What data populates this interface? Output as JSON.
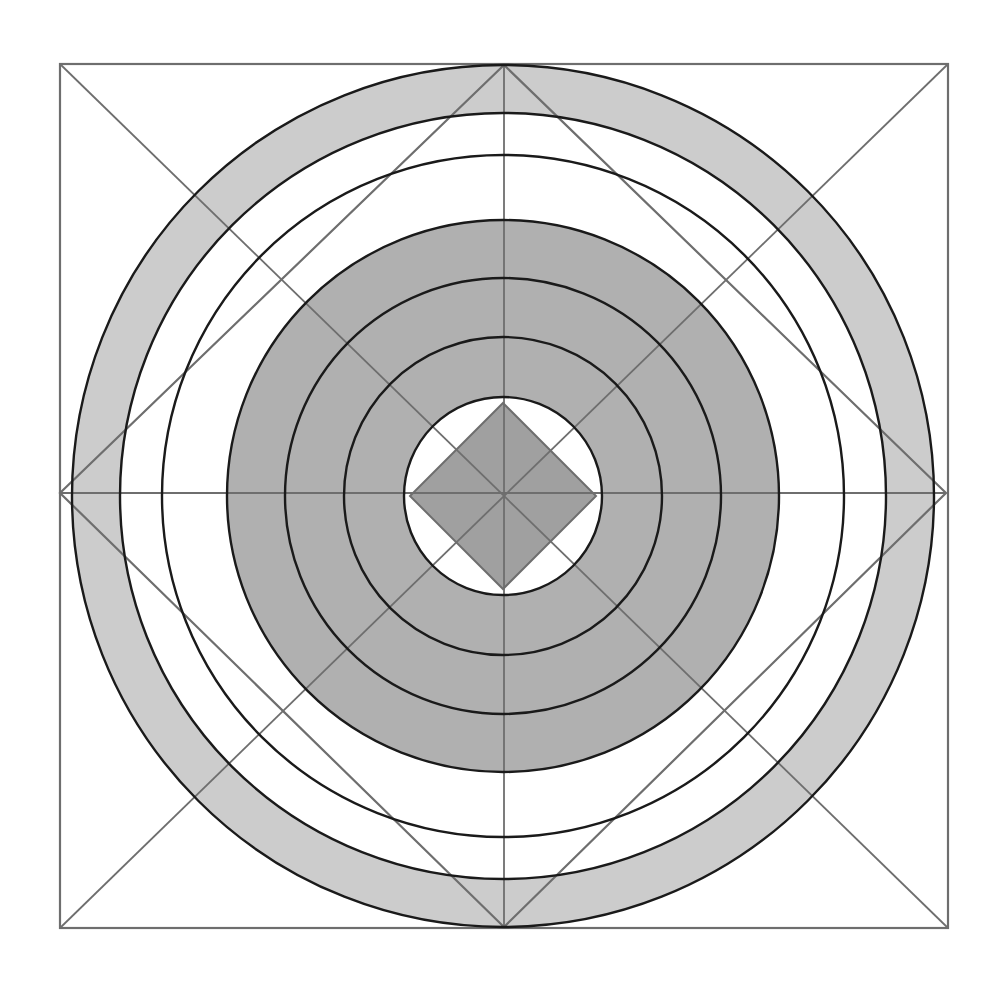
{
  "figure": {
    "title": "Concentric Circle Mandala with Inscribed Diamonds",
    "caption": "",
    "width": 1006,
    "height": 990,
    "background_color": "#ffffff"
  },
  "chart_data": {
    "type": "diagram",
    "subtype": "concentric-ring-geometric-figure",
    "title": "Concentric Circle Mandala with Inscribed Diamonds",
    "xlabel": "",
    "ylabel": "",
    "grid": false,
    "legend": false,
    "center": {
      "x": 503,
      "y": 496
    },
    "palette": {
      "background": "#ffffff",
      "light_gray": "#cccccc",
      "mid_gray": "#b0b0b0",
      "dark_gray": "#a0a0a0",
      "white_band": "#ffffff",
      "circle_stroke": "#1a1a1a",
      "frame_stroke": "#6e6e6e",
      "diamond_stroke": "#6e6e6e"
    },
    "frame": {
      "name": "outer-square-frame",
      "x": 60,
      "y": 64,
      "width": 888,
      "height": 864,
      "stroke": "#6e6e6e",
      "stroke_width": 2.2,
      "fill": "none"
    },
    "outer_diamond": {
      "name": "large-inscribed-diamond",
      "points": [
        {
          "x": 504,
          "y": 65
        },
        {
          "x": 946,
          "y": 493
        },
        {
          "x": 504,
          "y": 927
        },
        {
          "x": 60,
          "y": 493
        }
      ],
      "stroke": "#6e6e6e",
      "stroke_width": 2.2,
      "fill": "none"
    },
    "diagonals": [
      {
        "name": "horizontal-axis",
        "x1": 60,
        "y1": 493,
        "x2": 946,
        "y2": 493
      },
      {
        "name": "vertical-axis",
        "x1": 504,
        "y1": 65,
        "x2": 504,
        "y2": 927
      },
      {
        "name": "diagonal-nw-se",
        "x1": 60,
        "y1": 64,
        "x2": 948,
        "y2": 928
      },
      {
        "name": "diagonal-ne-sw",
        "x1": 948,
        "y1": 64,
        "x2": 60,
        "y2": 928
      }
    ],
    "center_diamond": {
      "name": "center-diamond",
      "radius": 93,
      "fill": "#a0a0a0",
      "stroke": "#6e6e6e",
      "stroke_width": 2
    },
    "circles": [
      {
        "index": 1,
        "name": "circle-ring-1-outer",
        "radius": 431,
        "fill_outward_band": "#cccccc",
        "stroke": "#1a1a1a",
        "stroke_width": 2.4
      },
      {
        "index": 2,
        "name": "circle-ring-2",
        "radius": 383,
        "fill_outward_band": "#cccccc",
        "stroke": "#1a1a1a",
        "stroke_width": 2.4
      },
      {
        "index": 3,
        "name": "circle-ring-3",
        "radius": 341,
        "fill_outward_band": "#ffffff",
        "stroke": "#1a1a1a",
        "stroke_width": 2.4
      },
      {
        "index": 4,
        "name": "circle-ring-4",
        "radius": 276,
        "fill_outward_band": "#b0b0b0",
        "stroke": "#1a1a1a",
        "stroke_width": 2.4
      },
      {
        "index": 5,
        "name": "circle-ring-5",
        "radius": 218,
        "fill_outward_band": "#b0b0b0",
        "stroke": "#1a1a1a",
        "stroke_width": 2.4
      },
      {
        "index": 6,
        "name": "circle-ring-6",
        "radius": 159,
        "fill_outward_band": "#b0b0b0",
        "stroke": "#1a1a1a",
        "stroke_width": 2.4
      },
      {
        "index": 7,
        "name": "circle-ring-7-inner",
        "radius": 99,
        "fill_outward_band": "#b0b0b0",
        "stroke": "#1a1a1a",
        "stroke_width": 2.4
      }
    ],
    "bands": [
      {
        "name": "band-outer-light",
        "inner_radius": 383,
        "outer_radius": 431,
        "fill": "#cccccc",
        "label": "outermost light gray annulus"
      },
      {
        "name": "band-white-1",
        "inner_radius": 341,
        "outer_radius": 383,
        "fill": "#ffffff",
        "label": "white annulus"
      },
      {
        "name": "band-white-2",
        "inner_radius": 276,
        "outer_radius": 341,
        "fill": "#ffffff",
        "label": "white annulus wide"
      },
      {
        "name": "band-mid-1",
        "inner_radius": 218,
        "outer_radius": 276,
        "fill": "#b0b0b0",
        "label": "mid gray annulus"
      },
      {
        "name": "band-mid-2",
        "inner_radius": 159,
        "outer_radius": 218,
        "fill": "#b0b0b0",
        "label": "mid gray annulus"
      },
      {
        "name": "band-mid-3",
        "inner_radius": 99,
        "outer_radius": 159,
        "fill": "#b0b0b0",
        "label": "mid gray annulus"
      },
      {
        "name": "band-core-white",
        "inner_radius": 0,
        "outer_radius": 99,
        "fill": "#ffffff",
        "label": "white core disc"
      }
    ],
    "radii": [
      431,
      383,
      341,
      276,
      218,
      159,
      99
    ],
    "annotations": []
  }
}
